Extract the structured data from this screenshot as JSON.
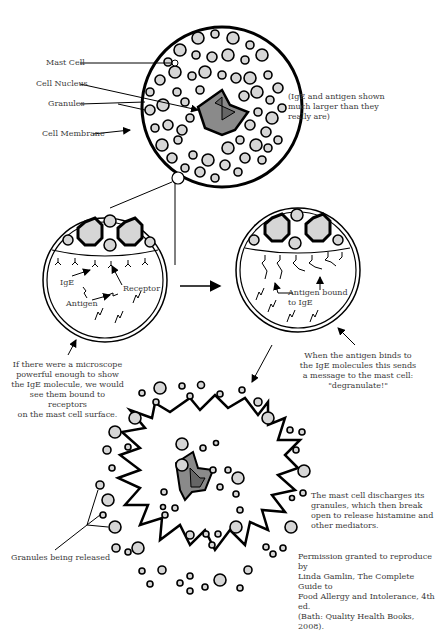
{
  "diagram": {
    "colors": {
      "granule_fill": "#d6d6d6",
      "nucleus_outer": "#8a8a8a",
      "nucleus_inner": "#666666",
      "stroke": "#000000"
    },
    "top_cell": {
      "labels": {
        "mast_cell": "Mast Cell",
        "cell_nucleus": "Cell Nucleus",
        "granules": "Granules",
        "cell_membrane": "Cell Membrane"
      },
      "note": [
        "(IgE and antigen shown",
        "much larger than they",
        "really are)"
      ]
    },
    "zoom_left": {
      "labels": {
        "ige": "IgE",
        "receptor": "Receptor",
        "antigen": "Antigen"
      },
      "caption": [
        "If there were a microscope",
        "powerful enough to show",
        "the IgE molecule, we would",
        "see them bound to receptors",
        "on the mast cell surface."
      ]
    },
    "zoom_right": {
      "labels": {
        "antigen_bound": [
          "Antigen bound",
          "to IgE"
        ]
      },
      "caption": [
        "When the antigen binds to",
        "the IgE molecules this sends",
        "a message to the mast cell:",
        "\"degranulate!\""
      ]
    },
    "bottom_cell": {
      "labels": {
        "granules_released": "Granules being released"
      },
      "caption": [
        "The mast cell discharges its",
        "granules, which then break",
        "open to release histamine and",
        "other mediators."
      ]
    },
    "credit": [
      "Permission granted to reproduce by",
      "Linda Gamlin, The Complete Guide to",
      "Food Allergy and Intolerance, 4th ed.",
      "(Bath: Quality Health Books, 2008)."
    ]
  }
}
